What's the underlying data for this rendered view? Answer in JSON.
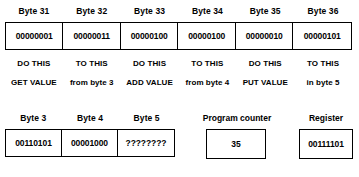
{
  "diagram": {
    "memory_row": {
      "captions": [
        "Byte 31",
        "Byte 32",
        "Byte 33",
        "Byte 34",
        "Byte 35",
        "Byte 36"
      ],
      "values": [
        "00000001",
        "00000011",
        "00000100",
        "00000100",
        "00000010",
        "00000101"
      ]
    },
    "operation_row": [
      "DO THIS",
      "TO THIS",
      "DO THIS",
      "TO THIS",
      "DO THIS",
      "TO THIS"
    ],
    "phrase_row": [
      "GET VALUE",
      "from byte 3",
      "ADD VALUE",
      "from byte 4",
      "PUT VALUE",
      "in byte 5"
    ],
    "data_row": {
      "captions": [
        "Byte 3",
        "Byte 4",
        "Byte 5"
      ],
      "values": [
        "00110101",
        "00001000",
        "????????"
      ]
    },
    "program_counter": {
      "label": "Program counter",
      "value": "35"
    },
    "register": {
      "label": "Register",
      "value": "00111101"
    }
  },
  "colors": {
    "ink": "#000000",
    "paper": "#ffffff"
  }
}
